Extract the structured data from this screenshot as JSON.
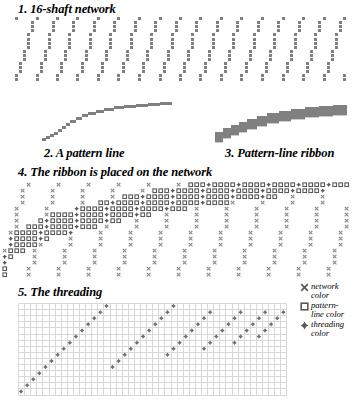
{
  "figure": {
    "panels": [
      {
        "id": "network",
        "caption": "1. 16-shaft network"
      },
      {
        "id": "pattern_line",
        "caption": "2. A pattern line"
      },
      {
        "id": "ribbon",
        "caption": "3. Pattern-line ribbon"
      },
      {
        "id": "placed",
        "caption": "4. The ribbon is placed on the network"
      },
      {
        "id": "threading",
        "caption": "5. The threading"
      }
    ]
  },
  "legend": {
    "items": [
      {
        "glyph": "x-mark-icon",
        "label_line1": "network",
        "label_line2": "color"
      },
      {
        "glyph": "open-square-icon",
        "label_line1": "pattern-",
        "label_line2": "line color"
      },
      {
        "glyph": "diamond-icon",
        "label_line1": "threading",
        "label_line2": "color"
      }
    ]
  },
  "colors": {
    "network_gray": "#808080",
    "mark_gray": "#6e6e6e",
    "grid_line": "#d8d8d8",
    "background": "#ffffff",
    "text": "#000000"
  },
  "chart_data": {
    "type": "heatmap",
    "xlabel": "",
    "ylabel": "",
    "network": {
      "shafts": 16,
      "columns": 84,
      "initial_repeat": 5,
      "description": "Diagonal network lines repeating every 5 warp ends over 16 shafts",
      "cell_px": 4.1
    },
    "pattern_line": {
      "description": "Rising staircase curve of pattern line, flattening toward the right",
      "points_x": [
        0,
        4,
        8,
        12,
        16,
        20,
        24,
        28,
        34,
        40,
        46,
        54,
        62,
        72,
        82,
        94,
        106,
        118,
        130
      ],
      "points_y": [
        40,
        38,
        36,
        34,
        31,
        28,
        25,
        22,
        19,
        16,
        14,
        12,
        10,
        8,
        7,
        6,
        5,
        4,
        3
      ],
      "step_height": 2.2
    },
    "ribbon": {
      "description": "Pattern line thickened into a ribbon of 4 shafts depth",
      "thickness": 4,
      "points_x": [
        0,
        8,
        16,
        24,
        32,
        42,
        52,
        64,
        76,
        90,
        104,
        118,
        132
      ],
      "points_y": [
        34,
        30,
        27,
        24,
        21,
        18,
        15,
        13,
        11,
        9,
        8,
        7,
        6
      ]
    },
    "threading": {
      "grid_columns": 44,
      "grid_rows": 15,
      "cell_px": 6.1,
      "description": "Sawtooth threading marks; each segment rises then drops back",
      "segments": [
        {
          "start_col": 0,
          "start_row": 14,
          "length": 17,
          "slope": -1
        },
        {
          "start_col": 15,
          "start_row": 10,
          "length": 11,
          "slope": -1
        },
        {
          "start_col": 24,
          "start_row": 8,
          "length": 8,
          "slope": -1
        },
        {
          "start_col": 30,
          "start_row": 7,
          "length": 7,
          "slope": -1
        },
        {
          "start_col": 35,
          "start_row": 6,
          "length": 6,
          "slope": -1
        },
        {
          "start_col": 39,
          "start_row": 5,
          "length": 5,
          "slope": -1
        }
      ]
    }
  }
}
